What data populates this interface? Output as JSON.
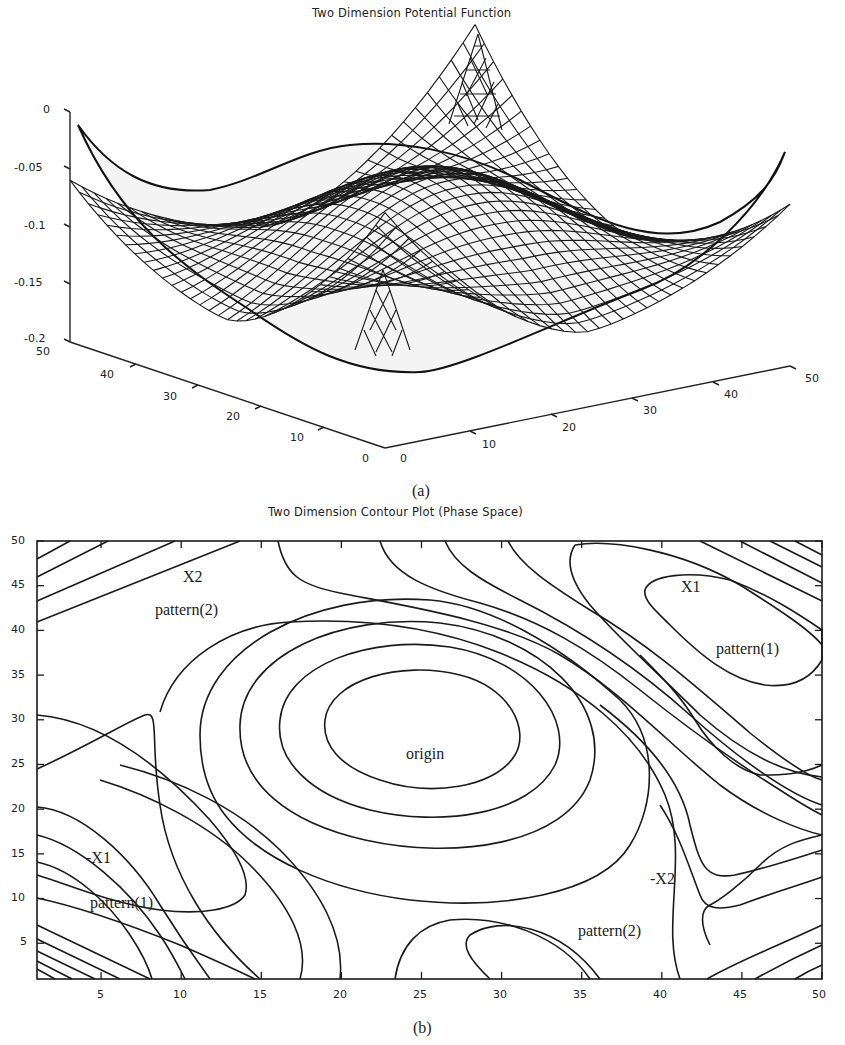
{
  "chart_data": [
    {
      "panel": "a",
      "type": "surface",
      "title": "Two Dimension Potential Function",
      "caption": "(a)",
      "zlabel": "",
      "z_ticks": [
        "0",
        "-0.05",
        "-0.1",
        "-0.15",
        "-0.2"
      ],
      "zlim": [
        -0.2,
        0
      ],
      "x_ticks": [
        "0",
        "10",
        "20",
        "30",
        "40",
        "50"
      ],
      "y_ticks": [
        "0",
        "10",
        "20",
        "30",
        "40",
        "50"
      ],
      "xlim": [
        0,
        50
      ],
      "ylim": [
        0,
        50
      ],
      "grid": false,
      "description": "Wireframe mesh of a 2D potential: central dome near z≈-0.05, corners rising toward 0, two sharp spikes (one at back near x≈25, one at front) reaching up to ~0"
    },
    {
      "panel": "b",
      "type": "contour",
      "title": "Two Dimension Contour Plot (Phase Space)",
      "caption": "(b)",
      "x_ticks": [
        "5",
        "10",
        "15",
        "20",
        "25",
        "30",
        "35",
        "40",
        "45",
        "50"
      ],
      "y_ticks": [
        "5",
        "10",
        "15",
        "20",
        "25",
        "30",
        "35",
        "40",
        "45",
        "50"
      ],
      "xlim": [
        1,
        50
      ],
      "ylim": [
        1,
        50
      ],
      "grid": false,
      "annotations": [
        {
          "text": "X2",
          "x": 11,
          "y": 46
        },
        {
          "text": "pattern(2)",
          "x": 11,
          "y": 41.5
        },
        {
          "text": "X1",
          "x": 43,
          "y": 46
        },
        {
          "text": "pattern(1)",
          "x": 46,
          "y": 37
        },
        {
          "text": "origin",
          "x": 25.5,
          "y": 25
        },
        {
          "text": "-X1",
          "x": 7,
          "y": 14
        },
        {
          "text": "pattern(1)",
          "x": 8,
          "y": 9.5
        },
        {
          "text": "-X2",
          "x": 39,
          "y": 11
        },
        {
          "text": "pattern(2)",
          "x": 38,
          "y": 4
        }
      ]
    }
  ]
}
